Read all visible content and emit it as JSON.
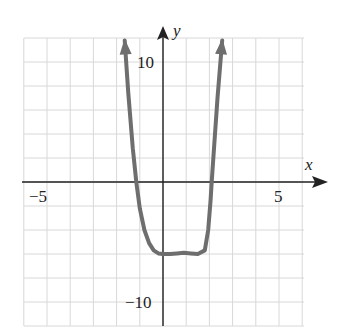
{
  "chart_data": {
    "type": "line",
    "title": "",
    "xlabel": "x",
    "ylabel": "y",
    "xlim": [
      -6,
      6
    ],
    "ylim": [
      -12,
      12
    ],
    "grid": true,
    "x_grid_step": 1,
    "y_grid_step": 2,
    "x_tick_labels": [
      "-5",
      "5"
    ],
    "y_tick_labels": [
      "10",
      "-10"
    ],
    "series": [
      {
        "name": "f(x)",
        "color": "#6e6e6e",
        "arrows_both_ends": true,
        "x": [
          -1.65,
          -1.5,
          -1.3,
          -1.15,
          -1.0,
          -0.8,
          -0.6,
          -0.4,
          -0.2,
          0.0,
          0.3,
          0.6,
          0.9,
          1.2,
          1.5,
          1.8,
          1.95,
          2.05,
          2.1,
          2.2,
          2.35,
          2.55
        ],
        "y": [
          11.8,
          7.5,
          2.8,
          0.0,
          -2.2,
          -4.0,
          -5.1,
          -5.7,
          -5.95,
          -6.0,
          -6.0,
          -5.95,
          -5.9,
          -5.95,
          -6.0,
          -5.7,
          -4.0,
          -1.5,
          0.0,
          2.8,
          7.0,
          11.8
        ]
      }
    ]
  },
  "labels": {
    "x_axis": "x",
    "y_axis": "y",
    "x_neg": "−5",
    "x_pos": "5",
    "y_pos": "10",
    "y_neg": "−10"
  }
}
